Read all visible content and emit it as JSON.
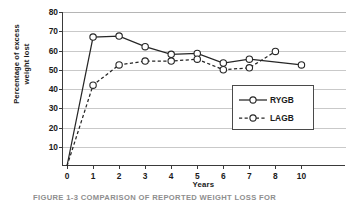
{
  "figure": {
    "caption": "FIGURE 1-3  COMPARISON OF REPORTED WEIGHT LOSS FOR"
  },
  "chart_data": {
    "type": "line",
    "title": "",
    "xlabel": "Years",
    "ylabel_line1": "Percentage of excess",
    "ylabel_line2": "weight lost",
    "x": [
      0,
      1,
      2,
      3,
      4,
      5,
      6,
      7,
      8,
      10
    ],
    "xtick_labels": [
      "0",
      "1",
      "2",
      "3",
      "4",
      "5",
      "6",
      "7",
      "8",
      "10"
    ],
    "ytick_labels": [
      "10",
      "20",
      "30",
      "40",
      "50",
      "60",
      "70",
      "80"
    ],
    "ytick_values": [
      10,
      20,
      30,
      40,
      50,
      60,
      70,
      80
    ],
    "ylim": [
      0,
      80
    ],
    "grid": "horizontal",
    "legend_position": "lower-right-inside",
    "series": [
      {
        "name": "RYGB",
        "style": "solid",
        "marker": "open-circle",
        "color": "#262626",
        "x": [
          0,
          1,
          2,
          3,
          4,
          5,
          6,
          7,
          10
        ],
        "values": [
          0,
          67,
          67.5,
          62,
          58,
          58.5,
          53.5,
          55.5,
          52.5
        ]
      },
      {
        "name": "LAGB",
        "style": "dashed",
        "marker": "open-circle",
        "color": "#262626",
        "x": [
          0,
          1,
          2,
          3,
          4,
          5,
          6,
          7,
          8
        ],
        "values": [
          0,
          42,
          52.5,
          54.5,
          54.5,
          55.5,
          50,
          51,
          59.5
        ]
      }
    ]
  },
  "legend": {
    "items": [
      {
        "label": "RYGB",
        "style": "solid"
      },
      {
        "label": "LAGB",
        "style": "dashed"
      }
    ]
  }
}
